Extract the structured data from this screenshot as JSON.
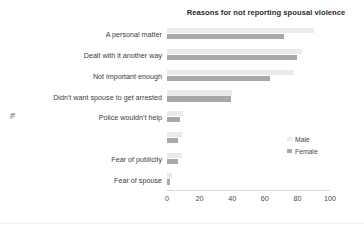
{
  "chart_data": {
    "type": "bar",
    "orientation": "horizontal",
    "title": "Reasons for not reporting spousal violence",
    "xlabel": "",
    "ylabel": "%",
    "xlim": [
      0,
      100
    ],
    "xticks": [
      "0",
      "20",
      "40",
      "60",
      "80",
      "100"
    ],
    "grid": false,
    "legend_position": "center right",
    "categories": [
      "A personal matter",
      "Dealt with it another way",
      "Not important enough",
      "Didn't want spouse to get arrested",
      "Police wouldn't help",
      "",
      "Fear of publicity",
      "Fear of spouse"
    ],
    "series": [
      {
        "name": "Male",
        "color": "#eaeaea",
        "values": [
          90,
          83,
          78,
          40,
          10,
          9,
          9,
          3
        ]
      },
      {
        "name": "Female",
        "color": "#a8a8a8",
        "values": [
          72,
          80,
          63,
          39,
          8,
          7,
          7,
          2
        ]
      }
    ]
  }
}
